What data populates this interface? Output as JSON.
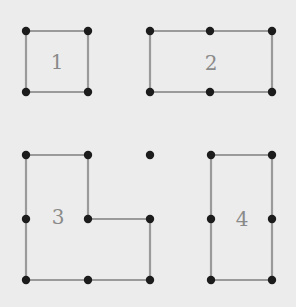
{
  "background": "#ececec",
  "edge_color": "#9a9a9a",
  "node_color": "#1c1c1c",
  "label_color": "#8a8a8a",
  "shapes": [
    {
      "label": "1",
      "label_pos": [
        57,
        63
      ],
      "nodes": [
        [
          26,
          31
        ],
        [
          88,
          31
        ],
        [
          88,
          92
        ],
        [
          26,
          92
        ]
      ],
      "polygon": [
        [
          26,
          31
        ],
        [
          88,
          31
        ],
        [
          88,
          92
        ],
        [
          26,
          92
        ]
      ]
    },
    {
      "label": "2",
      "label_pos": [
        211,
        64
      ],
      "nodes": [
        [
          150,
          31
        ],
        [
          210,
          31
        ],
        [
          272,
          31
        ],
        [
          272,
          92
        ],
        [
          210,
          92
        ],
        [
          150,
          92
        ]
      ],
      "polygon": [
        [
          150,
          31
        ],
        [
          272,
          31
        ],
        [
          272,
          92
        ],
        [
          150,
          92
        ]
      ]
    },
    {
      "label": "3",
      "label_pos": [
        58,
        218
      ],
      "nodes": [
        [
          26,
          155
        ],
        [
          88,
          155
        ],
        [
          88,
          219
        ],
        [
          150,
          219
        ],
        [
          150,
          280
        ],
        [
          88,
          280
        ],
        [
          26,
          280
        ],
        [
          26,
          219
        ]
      ],
      "polygon": [
        [
          26,
          155
        ],
        [
          88,
          155
        ],
        [
          88,
          219
        ],
        [
          150,
          219
        ],
        [
          150,
          280
        ],
        [
          26,
          280
        ]
      ]
    },
    {
      "label": "4",
      "label_pos": [
        242,
        220
      ],
      "nodes": [
        [
          211,
          155
        ],
        [
          272,
          155
        ],
        [
          272,
          219
        ],
        [
          272,
          280
        ],
        [
          211,
          280
        ],
        [
          211,
          219
        ]
      ],
      "polygon": [
        [
          211,
          155
        ],
        [
          272,
          155
        ],
        [
          272,
          280
        ],
        [
          211,
          280
        ]
      ]
    }
  ],
  "isolated_nodes": [
    [
      150,
      155
    ]
  ]
}
